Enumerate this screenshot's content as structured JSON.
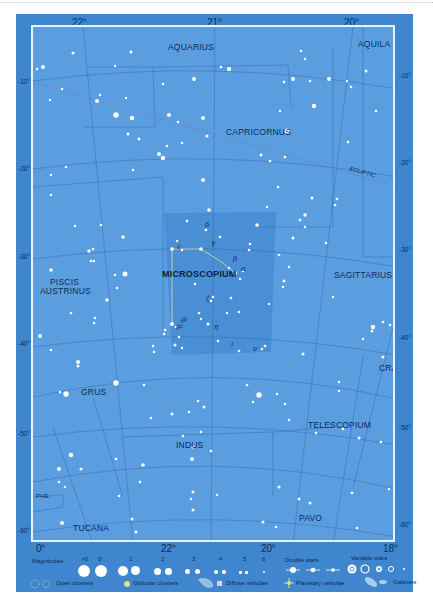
{
  "map": {
    "title": "Microscopium star chart",
    "colors": {
      "frame": "#3f86cf",
      "sky": "#5b9ee0",
      "highlight": "#4a8fd6",
      "border": "#eaf3fb",
      "label": "#0b2a55",
      "star": "#ffffff",
      "figure_line": "#c9d98a"
    },
    "ra_top": [
      {
        "label": "22",
        "unit": "h"
      },
      {
        "label": "21",
        "unit": "h"
      },
      {
        "label": "20",
        "unit": "h"
      }
    ],
    "ra_bottom": [
      {
        "label": "0",
        "unit": "h"
      },
      {
        "label": "22",
        "unit": "h"
      },
      {
        "label": "20",
        "unit": "h"
      },
      {
        "label": "18",
        "unit": "h"
      }
    ],
    "dec_left": [
      "-10°",
      "-20°",
      "-30°",
      "-40°",
      "-50°",
      "-60°"
    ],
    "dec_right": [
      "-10°",
      "-20°",
      "-30°",
      "-40°",
      "-50°",
      "-60°"
    ],
    "constellations": {
      "aquarius": "AQUARIUS",
      "aquila": "AQUILA",
      "capricornus": "CAPRICORNUS",
      "microscopium": "MICROSCOPIUM",
      "piscis_austrinus_1": "PISCIS",
      "piscis_austrinus_2": "AUSTRINUS",
      "sagittarius": "SAGITTARIUS",
      "grus": "GRUS",
      "cra": "CRA",
      "telescopium": "TELESCOPIUM",
      "indus": "INDUS",
      "phe": "PHE",
      "tucana": "TUCANA",
      "pavo": "PAVO"
    },
    "ecliptic_label": "ECLIPTIC",
    "greek_letters": {
      "delta": "δ",
      "gamma": "γ",
      "epsilon": "ε",
      "beta": "β",
      "alpha": "α",
      "zeta": "ζ",
      "theta1": "θ¹",
      "theta2": "θ²",
      "eta": "η",
      "iota": "ι",
      "nu": "ν"
    }
  },
  "legend": {
    "magnitudes_label": "Magnitudes:",
    "magnitudes": [
      ">0",
      "0",
      "1",
      "2",
      "3",
      "4",
      "5",
      "6"
    ],
    "double_stars": "Double stars",
    "variable_stars": "Variable stars",
    "open_clusters": "Open clusters",
    "globular_clusters": "Globular clusters",
    "diffuse_nebulae": "Diffuse nebulae",
    "planetary_nebulae": "Planetary nebulae",
    "galaxies": "Galaxies"
  }
}
